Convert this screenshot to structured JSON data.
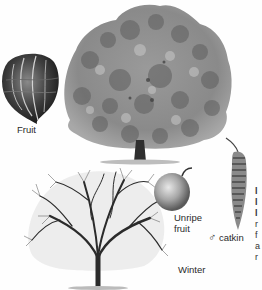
{
  "figure": {
    "style": "grayscale botanical illustration",
    "illustrations": [
      {
        "id": "fruit",
        "name": "Fruit (walnut, husk removed)"
      },
      {
        "id": "summer-tree",
        "name": "Tree in leaf"
      },
      {
        "id": "winter-tree",
        "name": "Tree in winter"
      },
      {
        "id": "unripe-fruit",
        "name": "Unripe fruit"
      },
      {
        "id": "male-catkin",
        "name": "Male catkin"
      }
    ]
  },
  "labels": {
    "fruit": "Fruit",
    "unripe_line1": "Unripe",
    "unripe_line2": "fruit",
    "catkin_symbol": "♂",
    "catkin": "catkin",
    "winter": "Winter"
  },
  "cropped_text_fragments": [
    "l",
    "l",
    "l",
    "r",
    "f",
    "a",
    "r"
  ],
  "colors": {
    "background": "#fefefe",
    "foliage_dark": "#5a5a5a",
    "foliage_mid": "#8c8c8c",
    "foliage_light": "#b8b8b8",
    "branches": "#2b2b2b",
    "text": "#2a2a2a"
  }
}
